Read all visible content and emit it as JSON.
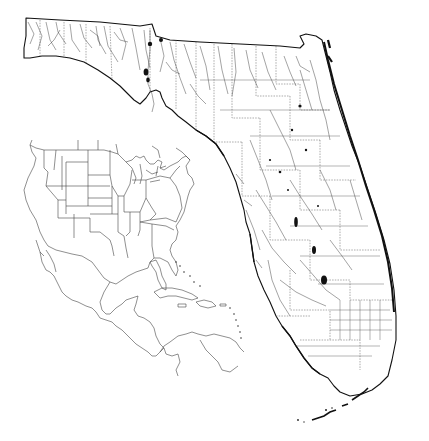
{
  "map": {
    "title": "",
    "subject": "Florida hydrography and transportation network",
    "background_color": "#ffffff",
    "line_color": "#222222",
    "main_region": "Florida",
    "inset": {
      "subject": "North America, Central America and Caribbean locator",
      "highlight": "Florida"
    },
    "features": [
      "state-outline",
      "county-boundaries",
      "rivers-and-streams",
      "lakes",
      "roads-grid-south-florida",
      "florida-keys",
      "panhandle-reservoirs"
    ],
    "labels": []
  }
}
